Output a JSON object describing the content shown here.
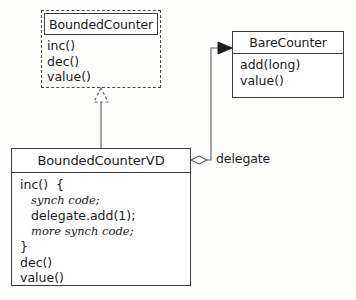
{
  "diagram": {
    "type": "uml-class-diagram",
    "background_color": "#fdfdfc",
    "line_color": "#4a4a4a",
    "text_color": "#1a1a1a"
  },
  "boxes": {
    "bounded_counter": {
      "name": "BoundedCounter",
      "style": "dashed-interface",
      "members": [
        "inc()",
        "dec()",
        "value()"
      ]
    },
    "bare_counter": {
      "name": "BareCounter",
      "style": "solid-class",
      "members": [
        "add(long)",
        "value()"
      ]
    },
    "bounded_counter_vd": {
      "name": "BoundedCounterVD",
      "style": "solid-class",
      "members": [
        {
          "text": "inc()  {",
          "style": "plain"
        },
        {
          "text": "synch code;",
          "style": "italic"
        },
        {
          "text": "delegate.add(1);",
          "style": "mono"
        },
        {
          "text": "more synch code;",
          "style": "italic"
        },
        {
          "text": "}",
          "style": "plain"
        },
        {
          "text": "dec()",
          "style": "plain"
        },
        {
          "text": "value()",
          "style": "plain"
        }
      ]
    }
  },
  "connectors": {
    "realization": {
      "label": "",
      "from": "BoundedCounterVD",
      "to": "BoundedCounter",
      "arrow": "hollow-triangle-dashed"
    },
    "aggregation": {
      "label": "delegate",
      "from": "BoundedCounterVD",
      "to": "BareCounter",
      "arrow": "filled-arrowhead",
      "source_decoration": "hollow-diamond"
    }
  }
}
